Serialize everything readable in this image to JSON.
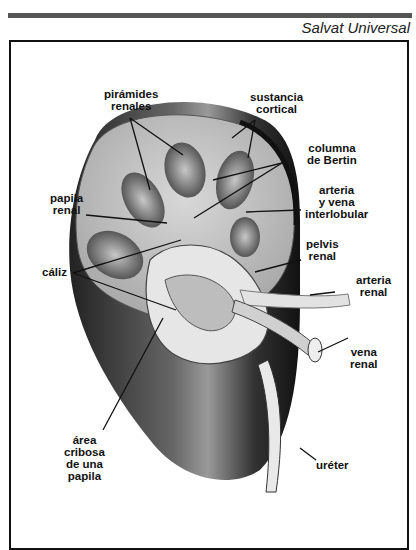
{
  "header": {
    "source": "Salvat Universal"
  },
  "figure": {
    "labels": {
      "piramides_1": "pirámides",
      "piramides_2": "renales",
      "sustancia_1": "sustancia",
      "sustancia_2": "cortical",
      "columna_1": "columna",
      "columna_2": "de Bertin",
      "arteria_inter_1": "arteria",
      "arteria_inter_2": "y vena",
      "arteria_inter_3": "interlobular",
      "papila_1": "papila",
      "papila_2": "renal",
      "pelvis_1": "pelvis",
      "pelvis_2": "renal",
      "caliz": "cáliz",
      "arteria_renal_1": "arteria",
      "arteria_renal_2": "renal",
      "vena_1": "vena",
      "vena_2": "renal",
      "area_1": "área",
      "area_2": "cribosa",
      "area_3": "de una",
      "area_4": "papila",
      "ureter": "uréter"
    }
  }
}
